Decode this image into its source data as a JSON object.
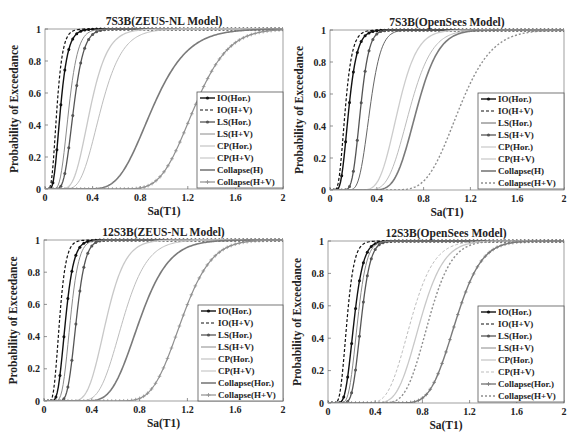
{
  "figure": {
    "width": 581,
    "height": 446
  },
  "chart_data": [
    {
      "type": "line",
      "title": "7S3B(ZEUS-NL Model)",
      "xlabel": "Sa(T1)",
      "ylabel": "Probability of Exceedance",
      "xlim": [
        0,
        2
      ],
      "ylim": [
        0,
        1
      ],
      "xticks": [
        "0",
        "0.4",
        "0.8",
        "1.2",
        "1.6",
        "2"
      ],
      "yticks": [
        "0",
        "0.2",
        "0.4",
        "0.6",
        "0.8",
        "1"
      ],
      "grid": false,
      "legend_position": "lower right",
      "box": {
        "x": 45,
        "y": 29,
        "w": 238,
        "h": 160
      },
      "legend_box": {
        "x": 197,
        "y": 92,
        "w": 86,
        "h": 96
      },
      "series": [
        {
          "name": "IO(Hor.)",
          "median": 0.13,
          "beta": 0.38,
          "color": "#111111",
          "dash": "",
          "marker": "dot",
          "width": 1.4
        },
        {
          "name": "IO(H+V)",
          "median": 0.1,
          "beta": 0.38,
          "color": "#111111",
          "dash": "3,2",
          "marker": "",
          "width": 1.2
        },
        {
          "name": "LS(Hor.)",
          "median": 0.24,
          "beta": 0.28,
          "color": "#555555",
          "dash": "",
          "marker": "dot",
          "width": 1.3
        },
        {
          "name": "LS(H+V)",
          "median": 0.2,
          "beta": 0.3,
          "color": "#8a8a8a",
          "dash": "",
          "marker": "",
          "width": 1.0
        },
        {
          "name": "CP(Hor.)",
          "median": 0.38,
          "beta": 0.3,
          "color": "#c8c8c8",
          "dash": "",
          "marker": "",
          "width": 1.3
        },
        {
          "name": "CP(H+V)",
          "median": 0.47,
          "beta": 0.3,
          "color": "#bdbdbd",
          "dash": "",
          "marker": "",
          "width": 1.0
        },
        {
          "name": "Collapse(H)",
          "median": 0.9,
          "beta": 0.26,
          "color": "#7a7a7a",
          "dash": "",
          "marker": "",
          "width": 1.6
        },
        {
          "name": "Collapse(H+V)",
          "median": 1.25,
          "beta": 0.18,
          "color": "#8f8f8f",
          "dash": "",
          "marker": "plus",
          "width": 1.2
        }
      ]
    },
    {
      "type": "line",
      "title": "7S3B(OpenSees Model)",
      "xlabel": "Sa(T1)",
      "ylabel": "Probability of Exceedance",
      "xlim": [
        0,
        2
      ],
      "ylim": [
        0,
        1
      ],
      "xticks": [
        "0",
        "0.4",
        "0.8",
        "1.2",
        "1.6",
        "2"
      ],
      "yticks": [
        "0",
        "0.2",
        "0.4",
        "0.6",
        "0.8",
        "1"
      ],
      "grid": false,
      "legend_position": "lower right",
      "box": {
        "x": 330,
        "y": 30,
        "w": 234,
        "h": 160
      },
      "legend_box": {
        "x": 478,
        "y": 93,
        "w": 86,
        "h": 96
      },
      "series": [
        {
          "name": "IO(Hor.)",
          "median": 0.16,
          "beta": 0.35,
          "color": "#111111",
          "dash": "",
          "marker": "dot",
          "width": 1.4
        },
        {
          "name": "IO(H+V)",
          "median": 0.13,
          "beta": 0.36,
          "color": "#111111",
          "dash": "3,2",
          "marker": "",
          "width": 1.2
        },
        {
          "name": "LS(Hor.)",
          "median": 0.34,
          "beta": 0.22,
          "color": "#666666",
          "dash": "",
          "marker": "",
          "width": 1.0
        },
        {
          "name": "LS(H+V)",
          "median": 0.26,
          "beta": 0.22,
          "color": "#555555",
          "dash": "",
          "marker": "dot",
          "width": 1.3
        },
        {
          "name": "CP(Hor.)",
          "median": 0.58,
          "beta": 0.22,
          "color": "#cccccc",
          "dash": "",
          "marker": "",
          "width": 1.3
        },
        {
          "name": "CP(H+V)",
          "median": 0.68,
          "beta": 0.22,
          "color": "#bbbbbb",
          "dash": "",
          "marker": "",
          "width": 1.0
        },
        {
          "name": "Collapse(H)",
          "median": 0.74,
          "beta": 0.2,
          "color": "#7a7a7a",
          "dash": "",
          "marker": "",
          "width": 1.6
        },
        {
          "name": "Collapse(H+V)",
          "median": 1.1,
          "beta": 0.2,
          "color": "#8f8f8f",
          "dash": "2,2",
          "marker": "",
          "width": 1.4
        }
      ]
    },
    {
      "type": "line",
      "title": "12S3B(ZEUS-NL Model)",
      "xlabel": "Sa(T1)",
      "ylabel": "Probability of Exceedance",
      "xlim": [
        0,
        2
      ],
      "ylim": [
        0,
        1
      ],
      "xticks": [
        "0",
        "0.4",
        "0.8",
        "1.2",
        "1.6",
        "2"
      ],
      "yticks": [
        "0",
        "0.2",
        "0.4",
        "0.6",
        "0.8",
        "1"
      ],
      "grid": false,
      "legend_position": "lower right",
      "box": {
        "x": 44,
        "y": 240,
        "w": 239,
        "h": 161
      },
      "legend_box": {
        "x": 198,
        "y": 305,
        "w": 85,
        "h": 96
      },
      "series": [
        {
          "name": "IO(Hor.)",
          "median": 0.18,
          "beta": 0.3,
          "color": "#111111",
          "dash": "",
          "marker": "dot",
          "width": 1.4
        },
        {
          "name": "IO(H+V)",
          "median": 0.13,
          "beta": 0.32,
          "color": "#111111",
          "dash": "3,2",
          "marker": "",
          "width": 1.2
        },
        {
          "name": "LS(Hor.)",
          "median": 0.27,
          "beta": 0.22,
          "color": "#555555",
          "dash": "",
          "marker": "dot",
          "width": 1.3
        },
        {
          "name": "LS(H+V)",
          "median": 0.22,
          "beta": 0.25,
          "color": "#8a8a8a",
          "dash": "",
          "marker": "",
          "width": 1.0
        },
        {
          "name": "CP(Hor.)",
          "median": 0.52,
          "beta": 0.24,
          "color": "#c8c8c8",
          "dash": "",
          "marker": "",
          "width": 1.3
        },
        {
          "name": "CP(H+V)",
          "median": 0.66,
          "beta": 0.24,
          "color": "#bdbdbd",
          "dash": "",
          "marker": "",
          "width": 1.0
        },
        {
          "name": "Collapse(Hor.)",
          "median": 0.8,
          "beta": 0.24,
          "color": "#7a7a7a",
          "dash": "",
          "marker": "",
          "width": 1.6
        },
        {
          "name": "Collapse(H+V)",
          "median": 1.15,
          "beta": 0.17,
          "color": "#8f8f8f",
          "dash": "",
          "marker": "plus",
          "width": 1.2
        }
      ]
    },
    {
      "type": "line",
      "title": "12S3B(OpenSees Model)",
      "xlabel": "Sa(T1)",
      "ylabel": "Probability of Exceedance",
      "xlim": [
        0,
        2
      ],
      "ylim": [
        0,
        1
      ],
      "xticks": [
        "0",
        "0.4",
        "0.8",
        "1.2",
        "1.6",
        "2"
      ],
      "yticks": [
        "0",
        "0.2",
        "0.4",
        "0.6",
        "0.8",
        "1"
      ],
      "grid": false,
      "legend_position": "lower right",
      "box": {
        "x": 328,
        "y": 241,
        "w": 236,
        "h": 162
      },
      "legend_box": {
        "x": 478,
        "y": 306,
        "w": 86,
        "h": 96
      },
      "series": [
        {
          "name": "IO(Hor.)",
          "median": 0.22,
          "beta": 0.28,
          "color": "#111111",
          "dash": "",
          "marker": "dot",
          "width": 1.4
        },
        {
          "name": "IO(H+V)",
          "median": 0.16,
          "beta": 0.3,
          "color": "#111111",
          "dash": "3,2",
          "marker": "",
          "width": 1.2
        },
        {
          "name": "LS(Hor.)",
          "median": 0.28,
          "beta": 0.22,
          "color": "#555555",
          "dash": "",
          "marker": "dot",
          "width": 1.3
        },
        {
          "name": "LS(H+V)",
          "median": 0.25,
          "beta": 0.24,
          "color": "#8a8a8a",
          "dash": "",
          "marker": "",
          "width": 1.0
        },
        {
          "name": "CP(Hor.)",
          "median": 0.78,
          "beta": 0.2,
          "color": "#c8c8c8",
          "dash": "",
          "marker": "",
          "width": 1.3
        },
        {
          "name": "CP(H+V)",
          "median": 0.7,
          "beta": 0.22,
          "color": "#bdbdbd",
          "dash": "3,2",
          "marker": "",
          "width": 1.0
        },
        {
          "name": "Collapse(Hor.)",
          "median": 1.08,
          "beta": 0.16,
          "color": "#7a7a7a",
          "dash": "",
          "marker": "plus",
          "width": 1.4
        },
        {
          "name": "Collapse(H+V)",
          "median": 0.85,
          "beta": 0.18,
          "color": "#8f8f8f",
          "dash": "2,2",
          "marker": "",
          "width": 1.4
        }
      ]
    }
  ]
}
